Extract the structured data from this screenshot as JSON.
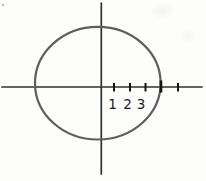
{
  "figure": {
    "type": "circle-on-coordinate-axes",
    "tick_labels": [
      "1",
      "2",
      "3"
    ],
    "colors": {
      "background": "#fdfdfc",
      "axis": "#2f2f2f",
      "circle": "#5e5e5e",
      "tick": "#141414",
      "label": "#1b1b1b"
    }
  }
}
